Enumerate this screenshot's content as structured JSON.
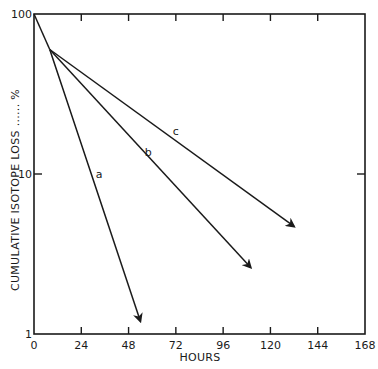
{
  "chart_data": {
    "type": "line",
    "title": "",
    "xlabel": "HOURS",
    "ylabel": "CUMULATIVE ISOTOPE LOSS ...... %",
    "xlim": [
      0,
      168
    ],
    "ylim": [
      1,
      100
    ],
    "yscale": "log",
    "grid": false,
    "legend": "inline labels",
    "x_ticks": [
      0,
      24,
      48,
      72,
      96,
      120,
      144,
      168
    ],
    "x_tick_labels": [
      "0",
      "24",
      "48",
      "72",
      "96",
      "120",
      "144",
      "168"
    ],
    "y_ticks": [
      1,
      10,
      100
    ],
    "y_tick_labels": [
      "1",
      "10",
      "100"
    ],
    "series": [
      {
        "name": "initial",
        "label": "",
        "x": [
          0,
          8
        ],
        "y": [
          100,
          60
        ],
        "arrow": false
      },
      {
        "name": "a",
        "label": "a",
        "x": [
          8,
          54
        ],
        "y": [
          60,
          1.2
        ],
        "arrow": true
      },
      {
        "name": "b",
        "label": "b",
        "x": [
          8,
          110
        ],
        "y": [
          60,
          2.6
        ],
        "arrow": true
      },
      {
        "name": "c",
        "label": "c",
        "x": [
          8,
          132
        ],
        "y": [
          60,
          4.7
        ],
        "arrow": true
      }
    ],
    "annotations": [
      {
        "text": "a",
        "x": 33,
        "y": 9.5
      },
      {
        "text": "b",
        "x": 58,
        "y": 13
      },
      {
        "text": "c",
        "x": 72,
        "y": 17.5
      }
    ]
  },
  "colors": {
    "ink": "#1a1a1a",
    "background": "#ffffff"
  }
}
